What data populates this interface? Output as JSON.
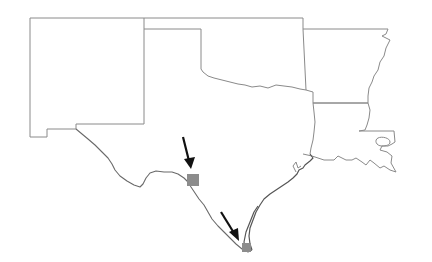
{
  "map": {
    "region": "South-central United States",
    "states": [
      "New Mexico",
      "Oklahoma",
      "Texas",
      "Arkansas",
      "Louisiana"
    ],
    "colors": {
      "background": "#ffffff",
      "state_border": "#8a8a8a",
      "marker_fill": "#8c8c8c",
      "arrow": "#111111"
    },
    "markers": [
      {
        "id": "marker-1",
        "label": "",
        "x": 187,
        "y": 174,
        "size": 12
      },
      {
        "id": "marker-2",
        "label": "",
        "x": 242,
        "y": 242,
        "size": 9
      }
    ],
    "arrows": [
      {
        "id": "arrow-1",
        "from": [
          183,
          137
        ],
        "to": [
          191,
          168
        ]
      },
      {
        "id": "arrow-2",
        "from": [
          221,
          212
        ],
        "to": [
          238,
          240
        ]
      }
    ]
  }
}
